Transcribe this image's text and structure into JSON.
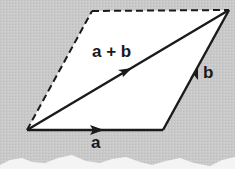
{
  "diagram": {
    "labels": {
      "a": "a",
      "b": "b",
      "sum": "a + b"
    },
    "colors": {
      "background": "#c9c9c9",
      "fill": "#ffffff",
      "stroke": "#1a1a1a"
    },
    "vertices": {
      "origin": [
        27,
        130
      ],
      "a_end": [
        163,
        130
      ],
      "sum_end": [
        229,
        10
      ],
      "b_start_alt": [
        92,
        11
      ]
    },
    "edges": [
      {
        "name": "vector-a",
        "from": "origin",
        "to": "a_end",
        "style": "solid",
        "arrow": "mid"
      },
      {
        "name": "vector-b",
        "from": "a_end",
        "to": "sum_end",
        "style": "solid",
        "arrow": "mid"
      },
      {
        "name": "vector-sum",
        "from": "origin",
        "to": "sum_end",
        "style": "solid",
        "arrow": "mid"
      },
      {
        "name": "edge-left",
        "from": "origin",
        "to": "b_start_alt",
        "style": "dashed"
      },
      {
        "name": "edge-top",
        "from": "b_start_alt",
        "to": "sum_end",
        "style": "dashed"
      }
    ]
  }
}
